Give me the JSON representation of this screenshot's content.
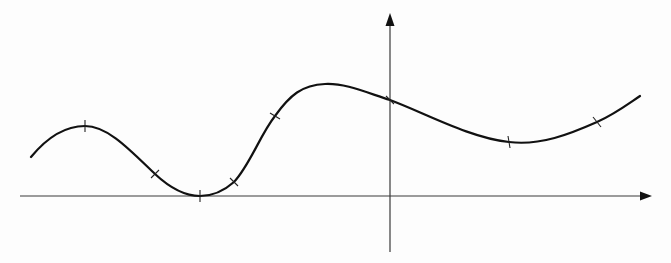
{
  "diagram": {
    "type": "function-graph",
    "colors": {
      "background": "#fdfdfd",
      "curve": "#111111",
      "axes": "#3a3a3a"
    },
    "axes": {
      "x_axis": {
        "y": 196,
        "x_start": 20,
        "x_end": 650,
        "arrow": "right"
      },
      "y_axis": {
        "x": 390,
        "y_start": 252,
        "y_end": 15,
        "arrow": "up"
      }
    },
    "curve": {
      "start": [
        31,
        157
      ],
      "end": [
        640,
        96
      ],
      "features": [
        {
          "kind": "local-max",
          "at": [
            85,
            126
          ]
        },
        {
          "kind": "local-min",
          "at": [
            200,
            196
          ],
          "note": "touches x-axis"
        },
        {
          "kind": "local-max",
          "at": [
            320,
            84
          ]
        },
        {
          "kind": "local-min",
          "at": [
            525,
            143
          ]
        }
      ]
    },
    "marked_points": [
      {
        "x": 85,
        "y": 126,
        "label": ""
      },
      {
        "x": 155,
        "y": 174,
        "label": ""
      },
      {
        "x": 200,
        "y": 196,
        "label": ""
      },
      {
        "x": 234,
        "y": 182,
        "label": ""
      },
      {
        "x": 275,
        "y": 116,
        "label": ""
      },
      {
        "x": 390,
        "y": 100,
        "label": ""
      },
      {
        "x": 509,
        "y": 142,
        "label": ""
      },
      {
        "x": 597,
        "y": 122,
        "label": ""
      }
    ]
  }
}
